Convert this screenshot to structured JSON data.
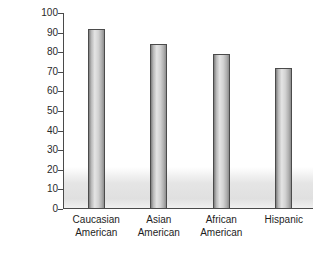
{
  "chart_data": {
    "type": "bar",
    "title": "",
    "xlabel": "",
    "ylabel": "PERCENTAGE",
    "categories": [
      "Caucasian American",
      "Asian American",
      "African American",
      "Hispanic"
    ],
    "category_lines": [
      [
        "Caucasian",
        "American"
      ],
      [
        "Asian",
        "American"
      ],
      [
        "African",
        "American"
      ],
      [
        "Hispanic"
      ]
    ],
    "values": [
      92,
      84,
      79,
      72
    ],
    "ylim": [
      0,
      100
    ],
    "ytick_step": 10,
    "yticks": [
      100,
      90,
      80,
      70,
      60,
      50,
      40,
      30,
      20,
      10,
      0
    ],
    "grid": false,
    "legend": false,
    "legend_position": "none",
    "bar_edge_color": "#4b4b4b",
    "bar_fill_light": "#e4e4e4",
    "bar_fill_dark": "#7e7e7e",
    "axis_color": "#4a4a4a",
    "background_color": "#ffffff"
  }
}
